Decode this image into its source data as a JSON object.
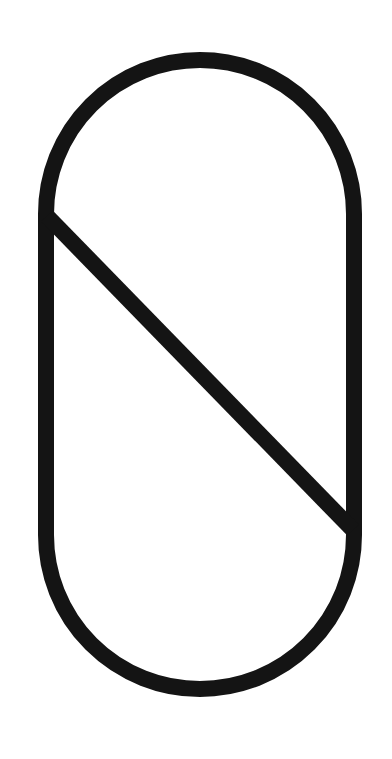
{
  "figure": {
    "name": "stadium-with-diagonal",
    "stroke_color": "#141414",
    "background_color": "#ffffff"
  }
}
